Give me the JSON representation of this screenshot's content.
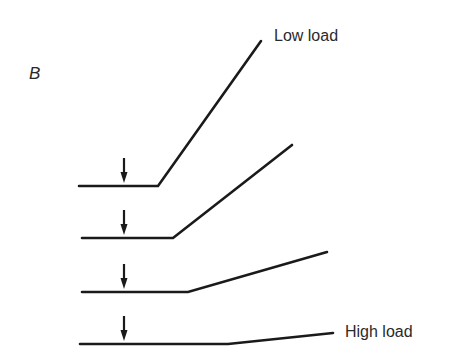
{
  "figure": {
    "panel_label": "B",
    "background": "#ffffff",
    "line_color": "#1a1a1a",
    "text_color": "#2a2a2a"
  },
  "labels": {
    "top": "Low load",
    "bottom": "High load"
  },
  "traces": [
    {
      "name": "low-load",
      "baseline_y": 186,
      "start_x": 79,
      "break_x": 158,
      "end": [
        261,
        41
      ],
      "arrow_x": 124
    },
    {
      "name": "medium-low-load",
      "baseline_y": 238,
      "start_x": 82,
      "break_x": 173,
      "end": [
        292,
        145
      ],
      "arrow_x": 124
    },
    {
      "name": "medium-high-load",
      "baseline_y": 292,
      "start_x": 82,
      "break_x": 188,
      "end": [
        327,
        252
      ],
      "arrow_x": 124
    },
    {
      "name": "high-load",
      "baseline_y": 344,
      "start_x": 80,
      "break_x": 228,
      "end": [
        333,
        333
      ],
      "arrow_x": 124
    }
  ]
}
